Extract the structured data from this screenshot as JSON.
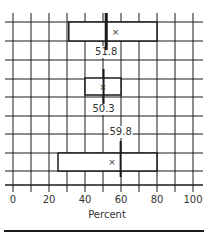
{
  "chart_data": {
    "type": "boxplot",
    "title": "",
    "xlabel": "Percent",
    "ylabel": "",
    "xlim": [
      0,
      100
    ],
    "x_ticks": [
      0,
      20,
      40,
      60,
      80,
      100
    ],
    "x_tick_labels": [
      "0",
      "20",
      "40",
      "60",
      "80",
      "100"
    ],
    "grid": true,
    "grid_step_x": 10,
    "series": [
      {
        "name": "Box 1",
        "q1": 31,
        "q3": 80,
        "median": 51.8,
        "mean": 57,
        "median_label": "51.8"
      },
      {
        "name": "Box 2",
        "q1": 40,
        "q3": 60,
        "median": 50.3,
        "mean": 50,
        "median_label": "50.3"
      },
      {
        "name": "Box 3",
        "q1": 25,
        "q3": 80,
        "median": 59.8,
        "mean": 55,
        "median_label": "59.8"
      }
    ],
    "mean_marker": "×"
  },
  "colors": {
    "grid": "#1a1a1a",
    "box": "#1a1a1a",
    "text": "#333333",
    "background": "#ffffff"
  }
}
